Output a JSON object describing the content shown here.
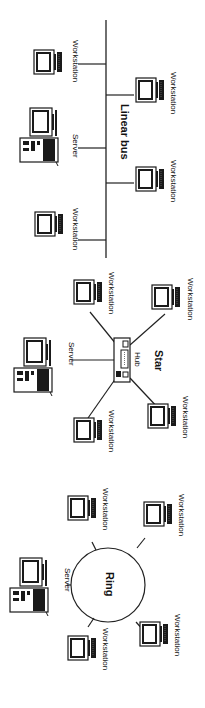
{
  "diagram": {
    "colors": {
      "line": "#222222",
      "background": "#ffffff",
      "device": "#1a1a1a"
    },
    "orientation": "rotated-90-clockwise",
    "topologies": [
      {
        "id": "linear-bus",
        "title": "Linear bus",
        "nodes": [
          {
            "type": "workstation",
            "label": "Workstation",
            "side": "left"
          },
          {
            "type": "server",
            "label": "Server",
            "side": "left"
          },
          {
            "type": "workstation",
            "label": "Workstation",
            "side": "left"
          },
          {
            "type": "workstation",
            "label": "Workstation",
            "side": "right"
          },
          {
            "type": "workstation",
            "label": "Workstation",
            "side": "right"
          }
        ]
      },
      {
        "id": "star",
        "title": "Star",
        "hub_label": "Hub",
        "nodes": [
          {
            "type": "server",
            "label": "Server"
          },
          {
            "type": "workstation",
            "label": "Workstation"
          },
          {
            "type": "workstation",
            "label": "Workstation"
          },
          {
            "type": "workstation",
            "label": "Workstation"
          },
          {
            "type": "workstation",
            "label": "Workstation"
          }
        ]
      },
      {
        "id": "ring",
        "title": "Ring",
        "nodes": [
          {
            "type": "server",
            "label": "Server"
          },
          {
            "type": "workstation",
            "label": "Workstation"
          },
          {
            "type": "workstation",
            "label": "Workstation"
          },
          {
            "type": "workstation",
            "label": "Workstation"
          },
          {
            "type": "workstation",
            "label": "Workstation"
          }
        ]
      }
    ]
  }
}
